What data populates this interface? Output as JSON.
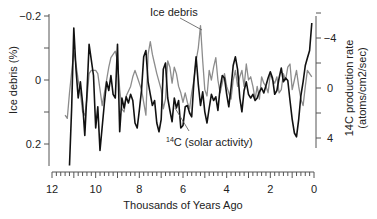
{
  "chart_data": {
    "type": "line",
    "title": "",
    "xlabel": "Thousands of Years Ago",
    "ylabel_left": "Ice debris (%)",
    "ylabel_right_line1": "14C production rate",
    "ylabel_right_line2": "(atoms/cm2/sec)",
    "x_ticks": [
      12,
      10,
      8,
      6,
      4,
      2,
      0
    ],
    "x_range": [
      12,
      0
    ],
    "y_left_ticks": [
      "-0.2",
      "0",
      "0.2"
    ],
    "y_left_range_inverted": [
      -0.2,
      0.2
    ],
    "y_right_ticks": [
      "-4",
      "0",
      "4"
    ],
    "y_right_range_inverted": [
      -4,
      4
    ],
    "grid": false,
    "annotations": [
      {
        "text": "Ice debris",
        "target_series": "Ice debris"
      },
      {
        "text_sup": "14",
        "text": "C (solar activity)",
        "target_series": "14C (solar activity)"
      }
    ],
    "series": [
      {
        "name": "Ice debris",
        "axis": "left",
        "color": "#8c8c8c",
        "x": [
          11.4,
          11.3,
          11.2,
          11.0,
          10.9,
          10.8,
          10.7,
          10.6,
          10.5,
          10.4,
          10.3,
          10.2,
          10.0,
          9.9,
          9.8,
          9.7,
          9.5,
          9.4,
          9.3,
          9.1,
          9.0,
          8.9,
          8.8,
          8.7,
          8.6,
          8.4,
          8.3,
          8.2,
          8.1,
          7.9,
          7.8,
          7.7,
          7.6,
          7.5,
          7.4,
          7.3,
          7.2,
          7.0,
          6.9,
          6.8,
          6.7,
          6.6,
          6.5,
          6.4,
          6.3,
          6.2,
          6.1,
          6.0,
          5.9,
          5.8,
          5.7,
          5.6,
          5.5,
          5.4,
          5.3,
          5.2,
          5.1,
          5.0,
          4.9,
          4.8,
          4.7,
          4.6,
          4.5,
          4.4,
          4.3,
          4.2,
          4.1,
          4.0,
          3.9,
          3.8,
          3.7,
          3.6,
          3.5,
          3.4,
          3.3,
          3.2,
          3.1,
          3.0,
          2.9,
          2.8,
          2.7,
          2.6,
          2.5,
          2.4,
          2.3,
          2.2,
          2.1,
          2.0,
          1.9,
          1.8,
          1.7,
          1.6,
          1.5,
          1.4,
          1.3,
          1.2,
          1.1,
          1.0,
          0.9,
          0.8,
          0.7,
          0.6,
          0.5,
          0.4,
          0.3,
          0.2,
          0.1
        ],
        "values": [
          0.11,
          0.12,
          0.04,
          -0.09,
          -0.05,
          0.0,
          0.04,
          0.1,
          0.11,
          0.06,
          -0.02,
          -0.03,
          -0.03,
          -0.02,
          0.03,
          0.08,
          0.0,
          -0.04,
          -0.07,
          -0.09,
          -0.06,
          0.03,
          0.09,
          0.1,
          0.05,
          0.02,
          -0.01,
          -0.03,
          -0.01,
          0.03,
          0.07,
          0.11,
          -0.08,
          -0.12,
          -0.08,
          -0.05,
          -0.02,
          0.03,
          0.09,
          0.06,
          -0.06,
          -0.04,
          0.01,
          -0.04,
          -0.02,
          0.02,
          0.04,
          0.07,
          0.04,
          0.07,
          0.09,
          0.04,
          0.0,
          -0.06,
          -0.1,
          -0.17,
          -0.06,
          0.03,
          0.05,
          -0.03,
          0.0,
          -0.04,
          -0.07,
          0.0,
          0.04,
          0.01,
          -0.02,
          0.02,
          0.04,
          0.06,
          0.0,
          -0.03,
          0.02,
          -0.01,
          -0.03,
          0.02,
          -0.05,
          0.0,
          -0.01,
          0.02,
          0.06,
          0.02,
          0.06,
          -0.01,
          0.01,
          0.02,
          0.04,
          -0.02,
          0.0,
          0.01,
          -0.01,
          0.04,
          0.03,
          -0.02,
          0.0,
          -0.04,
          -0.05,
          0.03,
          0.0,
          -0.03,
          0.02,
          0.06,
          0.08,
          0.02,
          -0.03,
          -0.02,
          -0.01
        ]
      },
      {
        "name": "14C (solar activity)",
        "axis": "right",
        "color": "#111111",
        "x": [
          11.2,
          11.1,
          11.0,
          10.9,
          10.8,
          10.7,
          10.6,
          10.5,
          10.4,
          10.3,
          10.1,
          10.0,
          9.9,
          9.8,
          9.6,
          9.5,
          9.4,
          9.3,
          9.2,
          9.1,
          9.0,
          8.9,
          8.8,
          8.7,
          8.6,
          8.5,
          8.4,
          8.3,
          8.2,
          8.1,
          8.0,
          7.9,
          7.8,
          7.7,
          7.6,
          7.5,
          7.4,
          7.3,
          7.2,
          7.1,
          7.0,
          6.9,
          6.8,
          6.7,
          6.6,
          6.5,
          6.4,
          6.3,
          6.2,
          6.1,
          6.0,
          5.9,
          5.8,
          5.7,
          5.6,
          5.5,
          5.4,
          5.3,
          5.2,
          5.1,
          5.0,
          4.9,
          4.8,
          4.7,
          4.6,
          4.5,
          4.4,
          4.3,
          4.2,
          4.1,
          4.0,
          3.9,
          3.8,
          3.7,
          3.6,
          3.5,
          3.4,
          3.3,
          3.2,
          3.1,
          3.0,
          2.9,
          2.8,
          2.7,
          2.6,
          2.5,
          2.4,
          2.3,
          2.2,
          2.1,
          2.0,
          1.9,
          1.8,
          1.7,
          1.6,
          1.5,
          1.4,
          1.3,
          1.2,
          1.1,
          1.0,
          0.9,
          0.8,
          0.7,
          0.6,
          0.5,
          0.4,
          0.3,
          0.2,
          0.1
        ],
        "values": [
          6.2,
          1.5,
          -4.8,
          -1.5,
          0.8,
          -0.5,
          1.2,
          3.8,
          0.5,
          -3.5,
          -1.0,
          3.2,
          1.5,
          5.0,
          1.2,
          -0.5,
          0.2,
          -1.0,
          0.5,
          0.8,
          -3.5,
          3.5,
          0.8,
          1.6,
          0.7,
          1.2,
          0.5,
          1.0,
          2.8,
          3.2,
          1.8,
          0.2,
          -2.5,
          -3.0,
          -0.5,
          0.5,
          1.4,
          1.0,
          2.8,
          3.5,
          2.5,
          -1.5,
          -2.0,
          0.8,
          1.8,
          2.7,
          0.8,
          1.6,
          1.0,
          3.2,
          3.0,
          1.5,
          1.4,
          2.0,
          2.3,
          -0.5,
          -2.5,
          -0.3,
          1.4,
          0.3,
          1.9,
          2.8,
          1.6,
          0.5,
          1.0,
          0.7,
          1.8,
          0.0,
          -1.0,
          -0.8,
          0.5,
          1.5,
          0.0,
          -1.8,
          -2.5,
          -1.5,
          0.8,
          1.9,
          0.2,
          -0.5,
          0.5,
          0.8,
          0.5,
          1.0,
          0.8,
          0.3,
          0.0,
          0.4,
          -0.2,
          -0.8,
          -1.3,
          -0.8,
          0.5,
          0.2,
          -0.8,
          -1.6,
          -0.5,
          -0.8,
          -0.6,
          1.0,
          2.5,
          3.6,
          3.9,
          2.5,
          0.6,
          -0.5,
          -1.8,
          -2.4,
          -3.0,
          -5.2
        ]
      }
    ]
  }
}
